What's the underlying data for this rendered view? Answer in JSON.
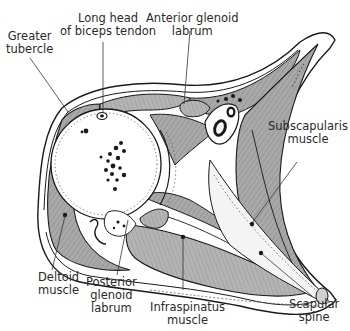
{
  "diagram": {
    "type": "anatomical-cross-section",
    "colors": {
      "background": "#ffffff",
      "line": "#1a1a1a",
      "muscle": "#a8a8a8",
      "bone": "#ffffff",
      "label": "#2a2a2a"
    },
    "labels": [
      {
        "id": "greater-tubercle",
        "lines": [
          "Greater",
          "tubercle"
        ]
      },
      {
        "id": "long-head-biceps-tendon",
        "lines": [
          "Long head",
          "of biceps tendon"
        ]
      },
      {
        "id": "anterior-glenoid-labrum",
        "lines": [
          "Anterior glenoid",
          "labrum"
        ]
      },
      {
        "id": "subscapularis-muscle",
        "lines": [
          "Subscapularis",
          "muscle"
        ]
      },
      {
        "id": "deltoid-muscle",
        "lines": [
          "Deltoid",
          "muscle"
        ]
      },
      {
        "id": "posterior-glenoid-labrum",
        "lines": [
          "Posterior",
          "glenoid",
          "labrum"
        ]
      },
      {
        "id": "infraspinatus-muscle",
        "lines": [
          "Infraspinatus",
          "muscle"
        ]
      },
      {
        "id": "scapular-spine",
        "lines": [
          "Scapular",
          "spine"
        ]
      }
    ]
  }
}
